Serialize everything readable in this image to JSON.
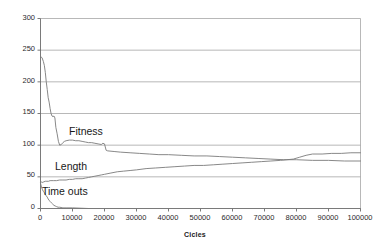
{
  "chart_data": {
    "type": "line",
    "title": "",
    "xlabel": "Cicles",
    "ylabel": "",
    "xlim": [
      0,
      100000
    ],
    "ylim": [
      0,
      300
    ],
    "grid": true,
    "legend_position": "inline-annotations",
    "x_ticks": [
      "0",
      "10000",
      "20000",
      "30000",
      "40000",
      "50000",
      "60000",
      "70000",
      "80000",
      "90000",
      "100000"
    ],
    "y_ticks": [
      "0",
      "50",
      "100",
      "150",
      "200",
      "250",
      "300"
    ],
    "annotations": [
      {
        "text": "Fitness",
        "x": 13000,
        "y": 118
      },
      {
        "text": "Length",
        "x": 8000,
        "y": 66
      },
      {
        "text": "Time outs",
        "x": 4000,
        "y": 20
      }
    ],
    "series": [
      {
        "name": "Fitness",
        "color": "#7a7a7a",
        "x": [
          0,
          500,
          900,
          1200,
          1500,
          1800,
          2100,
          2400,
          2700,
          3000,
          3300,
          3600,
          3900,
          4200,
          4500,
          4800,
          5200,
          5600,
          6000,
          6500,
          7000,
          7500,
          8000,
          9000,
          10000,
          11000,
          12000,
          13000,
          14000,
          15000,
          16000,
          17000,
          18000,
          19000,
          19500,
          20000,
          20500,
          21000,
          23000,
          25000,
          28000,
          31000,
          34000,
          37000,
          40000,
          44000,
          48000,
          52000,
          56000,
          60000,
          64000,
          68000,
          72000,
          76000,
          80000,
          85000,
          90000,
          95000,
          100000
        ],
        "y": [
          240,
          238,
          232,
          226,
          215,
          200,
          188,
          175,
          168,
          158,
          150,
          146,
          145,
          146,
          143,
          128,
          118,
          106,
          100,
          101,
          104,
          106,
          107,
          108,
          108,
          107,
          107,
          106,
          105,
          104,
          104,
          103,
          102,
          101,
          103,
          102,
          92,
          91,
          90,
          89,
          88,
          87,
          86,
          85,
          85,
          84,
          83,
          83,
          82,
          81,
          80,
          79,
          78,
          77,
          77,
          76,
          76,
          75,
          75
        ]
      },
      {
        "name": "Length",
        "color": "#7a7a7a",
        "x": [
          0,
          500,
          1000,
          1500,
          2000,
          2500,
          3000,
          4000,
          5000,
          6000,
          7000,
          8000,
          9000,
          10000,
          11000,
          12000,
          13000,
          14000,
          15000,
          16000,
          17000,
          18000,
          19000,
          20000,
          22000,
          24000,
          26000,
          28000,
          30000,
          33000,
          36000,
          39000,
          42000,
          45000,
          48000,
          51000,
          54000,
          57000,
          60000,
          63000,
          66000,
          69000,
          72000,
          75000,
          77000,
          79000,
          81000,
          83000,
          85000,
          88000,
          91000,
          94000,
          97000,
          100000
        ],
        "y": [
          43,
          41,
          42,
          43,
          43,
          43,
          44,
          44,
          44,
          45,
          45,
          45,
          46,
          46,
          47,
          47,
          47,
          48,
          49,
          50,
          51,
          52,
          53,
          54,
          56,
          58,
          59,
          60,
          61,
          63,
          64,
          65,
          66,
          67,
          68,
          68,
          69,
          70,
          71,
          72,
          73,
          74,
          75,
          76,
          77,
          78,
          81,
          84,
          86,
          86,
          87,
          87,
          88,
          88
        ]
      },
      {
        "name": "Time outs",
        "color": "#7a7a7a",
        "x": [
          0,
          300,
          600,
          900,
          1200,
          1500,
          1800,
          2100,
          2400,
          2700,
          3000,
          3400,
          3800,
          4200,
          4600,
          5000,
          5500,
          6000,
          7000,
          8000,
          10000,
          15000,
          20000,
          30000,
          40000,
          50000,
          60000,
          70000,
          80000,
          90000,
          100000
        ],
        "y": [
          40,
          34,
          30,
          27,
          25,
          22,
          20,
          18,
          15,
          13,
          11,
          9,
          7,
          5,
          4,
          3,
          2,
          2,
          1,
          1,
          1,
          0,
          0,
          0,
          0,
          0,
          0,
          0,
          0,
          0,
          0
        ]
      }
    ]
  }
}
